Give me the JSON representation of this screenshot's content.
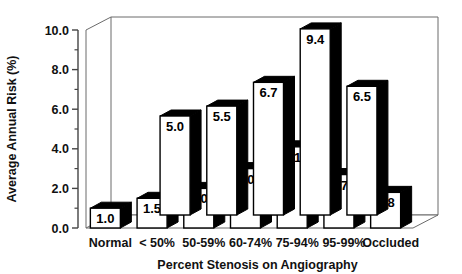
{
  "chart_data": {
    "type": "bar",
    "title": "",
    "subtitle": "",
    "xlabel": "Percent Stenosis on Angiography",
    "ylabel": "Average Annual Risk (%)",
    "categories": [
      "Normal",
      "< 50%",
      "50-59%",
      "60-74%",
      "75-94%",
      "95-99%",
      "Occluded"
    ],
    "ylim": [
      0.0,
      10.0
    ],
    "yticks": [
      "0.0",
      "2.0",
      "4.0",
      "6.0",
      "8.0",
      "10.0"
    ],
    "ytick_values": [
      0.0,
      2.0,
      4.0,
      6.0,
      8.0,
      10.0
    ],
    "minor_ticks": true,
    "grid": false,
    "legend": "none",
    "projection": "3d",
    "series": [
      {
        "name": "front-row",
        "row": "front",
        "values": [
          1.0,
          1.5,
          2.0,
          3.0,
          4.1,
          2.7,
          1.8
        ],
        "labels": [
          "1.0",
          "1.5",
          "2.0",
          "3.0",
          "4.1",
          "2.7",
          "1.8"
        ]
      },
      {
        "name": "back-row",
        "row": "back",
        "values": [
          null,
          5.0,
          5.5,
          6.7,
          9.4,
          6.5,
          null
        ],
        "labels": [
          "",
          "5.0",
          "5.5",
          "6.7",
          "9.4",
          "6.5",
          ""
        ]
      }
    ]
  },
  "colors": {
    "bar_face": "#ffffff",
    "bar_shade": "#000000",
    "axis": "#444444",
    "text": "#111111",
    "background": "#ffffff"
  }
}
